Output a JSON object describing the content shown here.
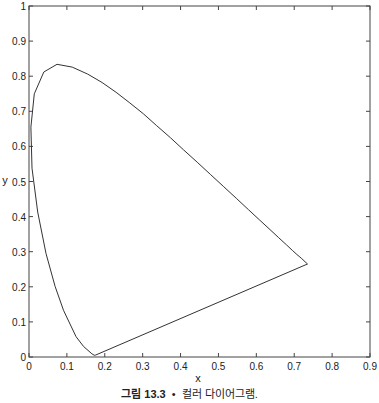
{
  "chart_data": {
    "type": "line",
    "title": "",
    "xlabel": "x",
    "ylabel": "y",
    "xlim": [
      0,
      0.9
    ],
    "ylim": [
      0,
      1
    ],
    "xticks": [
      "0",
      "0.1",
      "0.2",
      "0.3",
      "0.4",
      "0.5",
      "0.6",
      "0.7",
      "0.8",
      "0.9"
    ],
    "yticks": [
      "0",
      "0.1",
      "0.2",
      "0.3",
      "0.4",
      "0.5",
      "0.6",
      "0.7",
      "0.8",
      "0.9",
      "1"
    ],
    "grid": false,
    "legend": null,
    "series": [
      {
        "name": "spectral locus (closed)",
        "x": [
          0.175,
          0.172,
          0.166,
          0.144,
          0.124,
          0.091,
          0.069,
          0.045,
          0.023,
          0.008,
          0.005,
          0.014,
          0.039,
          0.074,
          0.114,
          0.155,
          0.193,
          0.23,
          0.266,
          0.302,
          0.337,
          0.373,
          0.408,
          0.444,
          0.479,
          0.513,
          0.547,
          0.579,
          0.609,
          0.636,
          0.659,
          0.679,
          0.695,
          0.707,
          0.715,
          0.72,
          0.735,
          0.175
        ],
        "y": [
          0.005,
          0.005,
          0.009,
          0.03,
          0.058,
          0.133,
          0.201,
          0.295,
          0.413,
          0.538,
          0.655,
          0.75,
          0.812,
          0.834,
          0.826,
          0.806,
          0.782,
          0.754,
          0.724,
          0.693,
          0.659,
          0.625,
          0.59,
          0.555,
          0.52,
          0.486,
          0.452,
          0.42,
          0.39,
          0.363,
          0.34,
          0.32,
          0.304,
          0.292,
          0.285,
          0.28,
          0.265,
          0.005
        ]
      }
    ]
  },
  "caption": {
    "figure_label": "그림 13.3",
    "bullet": "•",
    "text": "컬러 다이어그램."
  }
}
